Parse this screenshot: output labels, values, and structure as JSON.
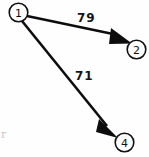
{
  "diagram": {
    "background_color": "#fefefe",
    "stroke_color": "#0d0d0d",
    "nodes": [
      {
        "id": "1",
        "label": "1",
        "cx": 18.5,
        "cy": 12.5,
        "r": 9.5
      },
      {
        "id": "2",
        "label": "2",
        "cx": 136.5,
        "cy": 49.5,
        "r": 9.5
      },
      {
        "id": "4",
        "label": "4",
        "cx": 124.5,
        "cy": 142.5,
        "r": 9.5
      }
    ],
    "edges": [
      {
        "id": "edge-1-2",
        "from": "1",
        "to": "2",
        "weight": "79",
        "weight_x": 77,
        "weight_y": 22,
        "x1": 27.0,
        "y1": 16.0,
        "x2": 113.0,
        "y2": 34.0,
        "head_points": "113,31 131,43 111,43"
      },
      {
        "id": "edge-1-4",
        "from": "1",
        "to": "4",
        "weight": "71",
        "weight_x": 75,
        "weight_y": 80,
        "x1": 22.0,
        "y1": 21.0,
        "x2": 104.0,
        "y2": 122.0,
        "head_points": "101,120 118,137 97,131"
      }
    ]
  },
  "artifact": {
    "text": "r"
  }
}
